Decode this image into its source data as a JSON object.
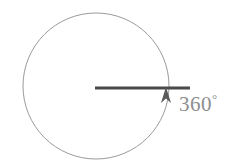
{
  "diagram": {
    "background_color": "#ffffff",
    "canvas": {
      "width": 246,
      "height": 167
    },
    "circle": {
      "name": "rotation-circle",
      "center_x": 96,
      "center_y": 86,
      "radius": 73,
      "stroke_color": "#9a9a9c",
      "stroke_width": 1,
      "fill": "none"
    },
    "radius_line": {
      "name": "horizontal-radius-line",
      "x1": 95,
      "y1": 88,
      "x2": 190,
      "y2": 88,
      "stroke_color": "#4a4a4a",
      "stroke_width": 3
    },
    "arrow": {
      "name": "rotation-arrowhead",
      "tip_x": 166,
      "tip_y": 87,
      "base_left_x": 161,
      "base_left_y": 103,
      "base_right_x": 171,
      "base_right_y": 103,
      "direction": "up",
      "fill_color": "#5a5a5c"
    },
    "label": {
      "value": "360",
      "degree_symbol": "°",
      "full_text": "360°",
      "color": "#8e8e90",
      "x": 179,
      "y": 92
    }
  }
}
